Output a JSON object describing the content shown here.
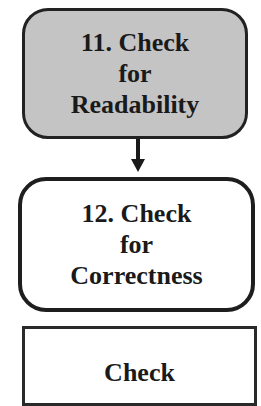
{
  "diagram": {
    "type": "flowchart",
    "steps": [
      {
        "number": "11.",
        "lines": [
          "11. Check",
          "for",
          "Readability"
        ],
        "fill": "#c4c4c4",
        "shape": "rounded-rectangle"
      },
      {
        "number": "12.",
        "lines": [
          "12. Check",
          "for",
          "Correctness"
        ],
        "fill": "#ffffff",
        "shape": "rounded-rectangle"
      },
      {
        "lines": [
          "Check"
        ],
        "fill": "#ffffff",
        "shape": "rectangle",
        "partially_visible": true
      }
    ],
    "connectors": [
      {
        "from": 0,
        "to": 1,
        "type": "arrow-down"
      }
    ]
  }
}
